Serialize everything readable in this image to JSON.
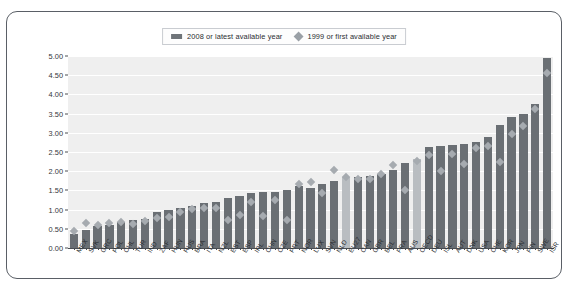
{
  "legend": {
    "position": "top-center",
    "entries": [
      {
        "icon": "bar-swatch",
        "label": "2008 or latest available year",
        "color": "#6e7378"
      },
      {
        "icon": "diamond-swatch",
        "label": "1999 or first available year",
        "color": "#9aa0a6"
      }
    ]
  },
  "colors": {
    "bar": "#6a6f74",
    "bar_highlight": "#b9bdc1",
    "marker": "#a6abb0",
    "plot_background": "#efefef",
    "gridline": "#ffffff",
    "axis": "#4a4e53",
    "frame": "#5a5f66"
  },
  "chart_data": {
    "type": "bar",
    "title": "",
    "subtitle": "",
    "xlabel": "",
    "ylabel": "",
    "ylim": [
      0.0,
      5.0
    ],
    "ytick_labels": [
      "0.00",
      "0.50",
      "1.00",
      "1.50",
      "2.00",
      "2.50",
      "3.00",
      "3.50",
      "4.00",
      "4.50",
      "5.00"
    ],
    "ytick_values": [
      0.0,
      0.5,
      1.0,
      1.5,
      2.0,
      2.5,
      3.0,
      3.5,
      4.0,
      4.5,
      5.0
    ],
    "grid": true,
    "highlight_categories": [
      "OECD",
      "EU27"
    ],
    "categories": [
      "MEX",
      "SVK",
      "GRC",
      "POL",
      "CHL",
      "TUR",
      "IND",
      "ZAF",
      "HUN",
      "RUS",
      "BRA",
      "ITA",
      "NZL",
      "EST",
      "ESP",
      "IRL",
      "CHN",
      "CZE",
      "PRT",
      "NOR",
      "LUX",
      "SVN",
      "NLD",
      "EU27",
      "CAN",
      "GBR",
      "BEL",
      "FRA",
      "AUS",
      "OECD",
      "DEU",
      "ISL",
      "AUT",
      "DNK",
      "USA",
      "CHE",
      "KOR",
      "JPN",
      "FIN",
      "SWE",
      "ISR"
    ],
    "series": [
      {
        "name": "2008 or latest available year",
        "type": "bar",
        "values": [
          0.37,
          0.47,
          0.58,
          0.6,
          0.67,
          0.72,
          0.76,
          0.93,
          1.0,
          1.03,
          1.09,
          1.18,
          1.21,
          1.29,
          1.35,
          1.43,
          1.47,
          1.47,
          1.51,
          1.62,
          1.56,
          1.66,
          1.75,
          1.84,
          1.86,
          1.88,
          1.92,
          2.02,
          2.21,
          2.33,
          2.63,
          2.65,
          2.67,
          2.72,
          2.77,
          2.9,
          3.21,
          3.42,
          3.49,
          3.75,
          4.95
        ]
      },
      {
        "name": "1999 or first available year",
        "type": "scatter",
        "marker": "diamond",
        "values": [
          0.43,
          0.65,
          0.6,
          0.65,
          0.68,
          0.62,
          0.7,
          0.76,
          0.81,
          0.92,
          1.0,
          1.03,
          1.02,
          0.72,
          0.86,
          1.18,
          0.82,
          1.25,
          0.71,
          1.65,
          1.72,
          1.41,
          2.01,
          1.85,
          1.8,
          1.79,
          1.92,
          2.16,
          1.5,
          2.26,
          2.42,
          2.0,
          2.45,
          2.18,
          2.6,
          2.65,
          2.24,
          2.95,
          3.17,
          3.6,
          4.55
        ]
      }
    ]
  }
}
